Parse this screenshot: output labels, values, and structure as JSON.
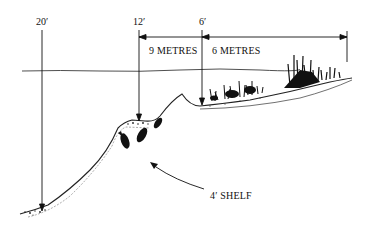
{
  "diagram": {
    "type": "cross-section",
    "depth_markers": [
      {
        "label": "20′",
        "x": 42
      },
      {
        "label": "12′",
        "x": 139
      },
      {
        "label": "6′",
        "x": 202
      }
    ],
    "distance_labels": [
      {
        "label": "9 METRES"
      },
      {
        "label": "6 METRES"
      }
    ],
    "callout": {
      "label": "4′ SHELF"
    },
    "features": [
      "water-surface-line",
      "lake-bed-profile",
      "fish",
      "shore-vegetation",
      "reeds"
    ],
    "colors": {
      "ink": "#111111",
      "background": "#ffffff"
    }
  }
}
